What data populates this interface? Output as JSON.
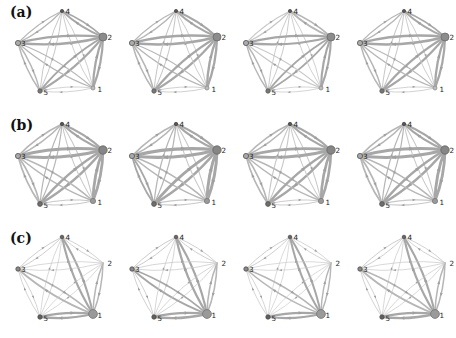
{
  "figure": {
    "background": "#ffffff",
    "columns": 4,
    "column_scales": [
      1.0,
      1.06,
      0.95,
      1.02
    ],
    "edge_curvature": 0.09,
    "edge_tiers": [
      {
        "min": 1.8,
        "color": "#a7a7a7"
      },
      {
        "min": 1.2,
        "color": "#b6b6b6"
      },
      {
        "min": 0.0,
        "color": "#c8c8c8"
      }
    ],
    "arrow_color": "#9f9f9f",
    "node_label_color": "#1b1b1b"
  },
  "nodes": [
    {
      "id": "4",
      "x": 62,
      "y": 11,
      "label_dx": 3.5,
      "label_dy": 2.5
    },
    {
      "id": "2",
      "x": 103,
      "y": 37,
      "label_dx": 4.5,
      "label_dy": 2.5
    },
    {
      "id": "1",
      "x": 93,
      "y": 88,
      "label_dx": 4.5,
      "label_dy": 3.5
    },
    {
      "id": "5",
      "x": 40,
      "y": 91,
      "label_dx": 3.5,
      "label_dy": 3.5
    },
    {
      "id": "3",
      "x": 18,
      "y": 43,
      "label_dx": 3.0,
      "label_dy": 2.5
    }
  ],
  "rows": [
    {
      "label": "(a)",
      "hub": "2",
      "pair_weights": {
        "1-2": 2.2,
        "2-3": 2.4,
        "2-4": 1.8,
        "2-5": 2.0,
        "1-3": 1.2,
        "3-5": 1.4,
        "3-4": 1.2,
        "4-5": 1.0,
        "1-5": 0.8,
        "1-4": 0.9
      },
      "node_styles": {
        "1": {
          "r": 2.0,
          "fill": "#bdbdbd",
          "stroke": "#8d8d8d"
        },
        "2": {
          "r": 4.0,
          "fill": "#8c8c8c",
          "stroke": "#6b6b6b"
        },
        "3": {
          "r": 2.6,
          "fill": "#ababab",
          "stroke": "#525252"
        },
        "4": {
          "r": 1.6,
          "fill": "#5a5a5a",
          "stroke": "#444444"
        },
        "5": {
          "r": 2.2,
          "fill": "#787878",
          "stroke": "#5a5a5a"
        }
      }
    },
    {
      "label": "(b)",
      "hub": "2",
      "pair_weights": {
        "1-2": 2.8,
        "2-3": 3.0,
        "2-4": 2.2,
        "2-5": 2.5,
        "1-3": 1.5,
        "3-5": 1.7,
        "3-4": 1.5,
        "4-5": 1.2,
        "1-5": 1.0,
        "1-4": 1.1
      },
      "node_styles": {
        "1": {
          "r": 2.6,
          "fill": "#9a9a9a",
          "stroke": "#787878"
        },
        "2": {
          "r": 4.2,
          "fill": "#868686",
          "stroke": "#636363"
        },
        "3": {
          "r": 2.6,
          "fill": "#a8a8a8",
          "stroke": "#525252"
        },
        "4": {
          "r": 1.7,
          "fill": "#565656",
          "stroke": "#444444"
        },
        "5": {
          "r": 2.4,
          "fill": "#6e6e6e",
          "stroke": "#525252"
        }
      }
    },
    {
      "label": "(c)",
      "hub": "1",
      "pair_weights": {
        "1-2": 1.5,
        "1-3": 1.7,
        "1-4": 2.1,
        "1-5": 2.3,
        "2-3": 0.7,
        "2-4": 0.8,
        "2-5": 0.7,
        "3-4": 0.9,
        "3-5": 0.8,
        "4-5": 0.7
      },
      "node_styles": {
        "1": {
          "r": 4.4,
          "fill": "#9a9a9a",
          "stroke": "#747474"
        },
        "2": {
          "r": 0,
          "fill": "#ffffff",
          "stroke": "#ffffff"
        },
        "3": {
          "r": 2.2,
          "fill": "#8a8a8a",
          "stroke": "#4a4a4a"
        },
        "4": {
          "r": 1.8,
          "fill": "#666666",
          "stroke": "#4f4f4f"
        },
        "5": {
          "r": 2.2,
          "fill": "#606060",
          "stroke": "#4a4a4a"
        }
      }
    }
  ]
}
